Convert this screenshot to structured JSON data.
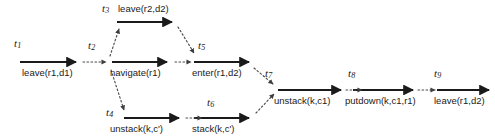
{
  "diagram": {
    "type": "directed-acyclic-action-graph",
    "background_color": "#ffffff",
    "solid_edge_color": "#1a1a1a",
    "dotted_edge_color": "#555555",
    "text_color": "#1a1a1a",
    "nodes": [
      {
        "id": "t1",
        "name": "t",
        "index": "1",
        "action": "leave(r1,d1)"
      },
      {
        "id": "t2",
        "name": "t",
        "index": "2",
        "action": "navigate(r1)"
      },
      {
        "id": "t3",
        "name": "t",
        "index": "3",
        "action": "leave(r2,d2)"
      },
      {
        "id": "t4",
        "name": "t",
        "index": "4",
        "action": "unstack(k,c')"
      },
      {
        "id": "t5",
        "name": "t",
        "index": "5",
        "action": "enter(r1,d2)"
      },
      {
        "id": "t6",
        "name": "t",
        "index": "6",
        "action": "stack(k,c')"
      },
      {
        "id": "t7",
        "name": "t",
        "index": "7",
        "action": "unstack(k,c1)"
      },
      {
        "id": "t8",
        "name": "t",
        "index": "8",
        "action": "putdown(k,c1,r1)"
      },
      {
        "id": "t9",
        "name": "t",
        "index": "9",
        "action": "leave(r1,d2)"
      }
    ],
    "edges": [
      {
        "from": "t1",
        "to": "t2",
        "style": "dotted"
      },
      {
        "from": "t2",
        "to": "t3",
        "style": "dotted"
      },
      {
        "from": "t2",
        "to": "t4",
        "style": "dotted"
      },
      {
        "from": "t2",
        "to": "t5",
        "style": "dotted"
      },
      {
        "from": "t3",
        "to": "t5",
        "style": "dotted"
      },
      {
        "from": "t4",
        "to": "t6",
        "style": "dotted"
      },
      {
        "from": "t5",
        "to": "t7",
        "style": "dotted"
      },
      {
        "from": "t6",
        "to": "t7",
        "style": "dotted"
      },
      {
        "from": "t7",
        "to": "t8",
        "style": "dotted"
      },
      {
        "from": "t8",
        "to": "t9",
        "style": "dotted"
      }
    ]
  }
}
